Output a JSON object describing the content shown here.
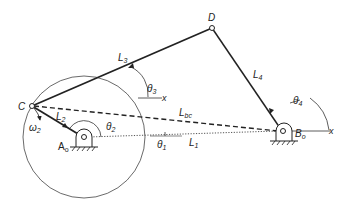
{
  "diagram": {
    "points": {
      "C": "C",
      "D": "D",
      "A0": {
        "base": "A",
        "sub": "o"
      },
      "B0": {
        "base": "B",
        "sub": "o"
      }
    },
    "links": {
      "L1": {
        "base": "L",
        "sub": "1"
      },
      "L2": {
        "base": "L",
        "sub": "2"
      },
      "L3": {
        "base": "L",
        "sub": "3"
      },
      "L4": {
        "base": "L",
        "sub": "4"
      },
      "Lbc": {
        "base": "L",
        "sub": "bc"
      }
    },
    "angles": {
      "theta1": {
        "base": "θ",
        "sub": "1"
      },
      "theta2": {
        "base": "θ",
        "sub": "2"
      },
      "theta3": {
        "base": "θ",
        "sub": "3"
      },
      "theta4": {
        "base": "θ",
        "sub": "4"
      }
    },
    "omega2": {
      "base": "ω",
      "sub": "2"
    },
    "x_axis_label": "x"
  }
}
